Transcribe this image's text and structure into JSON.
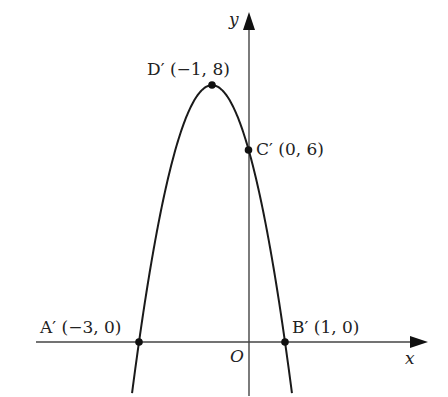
{
  "figure": {
    "type": "parabola-graph",
    "axes": {
      "x_label": "x",
      "y_label": "y",
      "origin_label": "O"
    },
    "curve": {
      "equation": "y = -2(x + 1)^2 + 8",
      "color": "#1a1a1a"
    },
    "points": [
      {
        "id": "A",
        "label": "A′ (−3, 0)",
        "x": -3,
        "y": 0
      },
      {
        "id": "B",
        "label": "B′ (1, 0)",
        "x": 1,
        "y": 0
      },
      {
        "id": "C",
        "label": "C′ (0, 6)",
        "x": 0,
        "y": 6
      },
      {
        "id": "D",
        "label": "D′ (−1, 8)",
        "x": -1,
        "y": 8
      }
    ],
    "colors": {
      "axis": "#444444",
      "curve": "#1a1a1a",
      "text": "#222222"
    }
  }
}
